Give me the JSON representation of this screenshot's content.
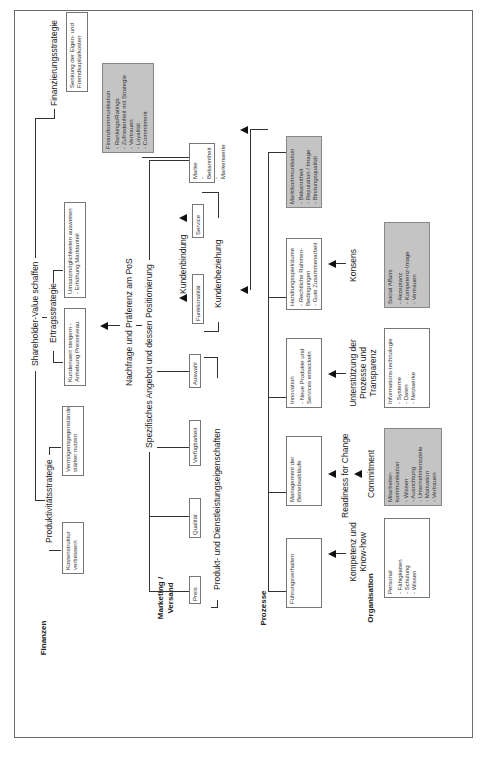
{
  "sections": {
    "finanzen": "Finanzen",
    "marketing": "Marketing / Versand",
    "prozesse": "Prozesse",
    "organisation": "Organisation"
  },
  "finanzen": {
    "goal": "Shareholder-Value schaffen",
    "strategies": [
      {
        "label": "Produktivitätsstrategie",
        "boxes": [
          "Kostenstruktur verbessern",
          "Vermögensgegenstände stärker nutzen"
        ]
      },
      {
        "label": "Ertragsstrategie",
        "boxes": [
          "Kundenwert steigern - Anhebung Preisniveau",
          "Umsatzmöglichkeiten ausweiten - Erhöhung Marktanteil"
        ]
      },
      {
        "label": "Finanzierungsstrategie",
        "boxes": [
          "Senkung der Eigen- und Fremdkapitalkosten"
        ]
      }
    ],
    "finanzkommunikation": {
      "title": "Finanzkommunikation",
      "items": [
        "Rankings/Ratings",
        "Zufriedenheit mit Strategie",
        "Vertrauen",
        "Loyalität",
        "Commitment"
      ]
    }
  },
  "marketing": {
    "nachfrage": "Nachfrage und Präferenz am PoS",
    "angebot": "Spezifisches Angebot und dessen Positionierung",
    "eigenschaften_label": "Produkt- und Dienstleistungseigenschaften",
    "eigenschaften": [
      "Preis",
      "Qualität",
      "Verfügbarkeit",
      "Auswahl"
    ],
    "kundenbindung": "Kundenbindung",
    "kundenbeziehung_label": "Kundenbeziehung",
    "kundenbeziehung": [
      "Funktionalität",
      "Service"
    ],
    "marke": {
      "title": "Marke",
      "items": [
        "Bekanntheit",
        "Markenwerte"
      ]
    }
  },
  "prozesse": {
    "boxes": [
      {
        "title": "Führungsverhalten",
        "items": []
      },
      {
        "title": "Management der Betriebsabläufe",
        "items": []
      },
      {
        "title": "Innovation",
        "items": [
          "Neue Produkte und Services entwickeln"
        ]
      },
      {
        "title": "Handlungsspielräume",
        "items": [
          "Rechtliche Rahmen-Bedingungen",
          "Gute Zusammenarbeit"
        ]
      }
    ],
    "marktkommunikation": {
      "title": "Marktkommunikation",
      "items": [
        "Bekanntheit",
        "Reputation / Image",
        "Bindungsqualität"
      ]
    }
  },
  "organisation": {
    "links": [
      "Kompetenz und Know-how",
      "Readiness for Change",
      "Commitment",
      "Unterstützung der Prozesse und Transparenz",
      "Konsens"
    ],
    "boxes": [
      {
        "title": "Personal",
        "items": [
          "Fähigkeiten",
          "Schulung",
          "Wissen"
        ],
        "grey": false
      },
      {
        "title": "Mitarbeiter-kommunikation",
        "items": [
          "Wissen",
          "Ausrichtung",
          "Unternehmensziele",
          "Motivation",
          "Vertrauen"
        ],
        "grey": true
      },
      {
        "title": "Informations-technologie",
        "items": [
          "Systeme",
          "Daten",
          "Netzwerke"
        ],
        "grey": false
      },
      {
        "title": "Social Affairs",
        "items": [
          "Akzeptanz",
          "Kompetenz-Image",
          "Vertrauen"
        ],
        "grey": true
      }
    ]
  },
  "colors": {
    "grey_box": "#c4c4c4",
    "line": "#333333",
    "frame": "#6a6a6a"
  }
}
